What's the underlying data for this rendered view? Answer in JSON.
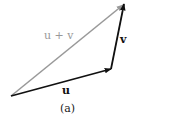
{
  "figure": {
    "caption": "(a)",
    "vectors": [
      {
        "name": "u",
        "label": "u",
        "from": [
          11,
          96
        ],
        "to": [
          111,
          69
        ],
        "color": "#111111",
        "bold": true
      },
      {
        "name": "v",
        "label": "v",
        "from": [
          111,
          69
        ],
        "to": [
          124,
          4
        ],
        "color": "#111111",
        "bold": true
      },
      {
        "name": "u_plus_v",
        "label": "u + v",
        "from": [
          11,
          96
        ],
        "to": [
          124,
          4
        ],
        "color": "#999999",
        "bold": false
      }
    ],
    "colors": {
      "dark": "#111111",
      "gray": "#999999",
      "background": "#ffffff"
    }
  }
}
